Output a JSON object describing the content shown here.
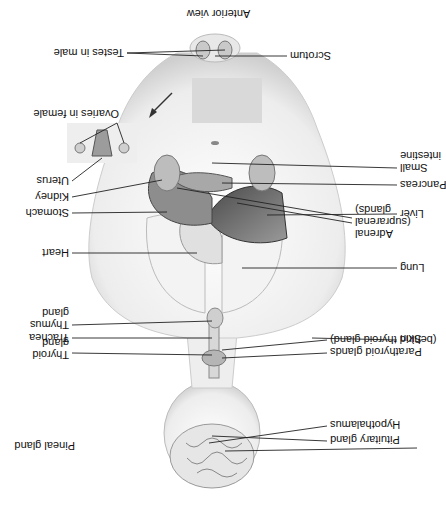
{
  "diagram": {
    "title": "Anterior view",
    "orientation": "rotated 180 degrees",
    "labels_left": [
      {
        "id": "pineal",
        "text": "Pineal gland"
      },
      {
        "id": "parathyroid",
        "text": "Parathyroid glands\n(behind thyroid gland)"
      },
      {
        "id": "skin",
        "text": "Skin"
      },
      {
        "id": "lung",
        "text": "Lung"
      },
      {
        "id": "adrenal",
        "text": "Adrenal\n(suprarenal\nglands)"
      },
      {
        "id": "liver",
        "text": "Liver"
      },
      {
        "id": "pancreas",
        "text": "Pancreas"
      },
      {
        "id": "small-intestine",
        "text": "Small\nintestine"
      },
      {
        "id": "scrotum",
        "text": "Scrotum"
      }
    ],
    "labels_right": [
      {
        "id": "hypothalamus",
        "text": "Hypothalamus"
      },
      {
        "id": "pituitary",
        "text": "Pituitary gland"
      },
      {
        "id": "thyroid",
        "text": "Thyroid\ngland"
      },
      {
        "id": "trachea",
        "text": "Trachea"
      },
      {
        "id": "thymus",
        "text": "Thymus\ngland"
      },
      {
        "id": "heart",
        "text": "Heart"
      },
      {
        "id": "stomach",
        "text": "Stomach"
      },
      {
        "id": "kidney",
        "text": "Kidney"
      },
      {
        "id": "uterus",
        "text": "Uterus"
      },
      {
        "id": "ovaries",
        "text": "Ovaries in female"
      },
      {
        "id": "testes",
        "text": "Testes in male"
      }
    ]
  }
}
